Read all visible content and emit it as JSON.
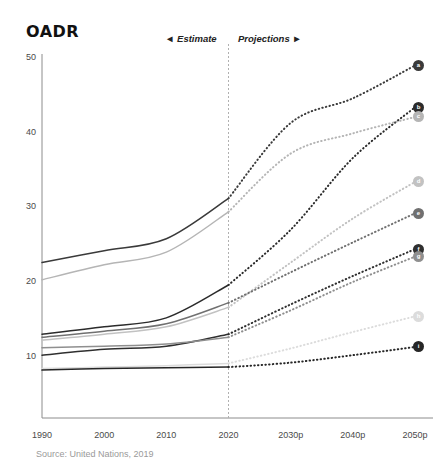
{
  "header": {
    "title": "OADR"
  },
  "annotations": {
    "estimate_label": "◄ Estimate",
    "projections_label": "Projections ►",
    "divider_year": 2020
  },
  "source": {
    "text": "Source: United Nations, 2019"
  },
  "colors": {
    "axis": "#8c8c8c",
    "tick_text": "#4a4a4a",
    "title": "#111111",
    "source_text": "#9a9a9a",
    "divider": "#b0b0b0"
  },
  "chart_data": {
    "type": "line",
    "title": "OADR",
    "xlabel": "",
    "ylabel": "",
    "xlim": [
      1990,
      2050
    ],
    "ylim": [
      5,
      50
    ],
    "yticks": [
      10,
      20,
      30,
      40,
      50
    ],
    "xticks": [
      "1990",
      "2000",
      "2010",
      "2020",
      "2030p",
      "2040p",
      "2050p"
    ],
    "xtick_values": [
      1990,
      2000,
      2010,
      2020,
      2030,
      2040,
      2050
    ],
    "grid": false,
    "legend": "none",
    "estimate_range": [
      1990,
      2020
    ],
    "projection_range": [
      2020,
      2050
    ],
    "x": [
      1990,
      2000,
      2010,
      2020,
      2030,
      2040,
      2050
    ],
    "series": [
      {
        "name": "series-a",
        "marker_letter": "a",
        "color": "#3a3a3a",
        "values": [
          22.6,
          24.2,
          25.8,
          31.2,
          41.3,
          44.6,
          49.0
        ]
      },
      {
        "name": "series-b",
        "marker_letter": "b",
        "color": "#2b2b2b",
        "values": [
          13.0,
          14.0,
          15.2,
          19.6,
          27.0,
          36.6,
          43.4
        ]
      },
      {
        "name": "series-c",
        "marker_letter": "c",
        "color": "#b5b5b5",
        "values": [
          20.3,
          22.3,
          24.0,
          29.4,
          37.2,
          39.9,
          42.1
        ]
      },
      {
        "name": "series-d",
        "marker_letter": "d",
        "color": "#c2c2c2",
        "values": [
          12.2,
          13.0,
          14.0,
          16.6,
          22.6,
          28.5,
          33.4
        ]
      },
      {
        "name": "series-e",
        "marker_letter": "e",
        "color": "#707070",
        "values": [
          12.6,
          13.4,
          14.4,
          17.2,
          21.3,
          25.3,
          29.2
        ]
      },
      {
        "name": "series-f",
        "marker_letter": "f",
        "color": "#2f2f2f",
        "values": [
          10.2,
          11.0,
          11.4,
          13.0,
          17.0,
          20.8,
          24.4
        ]
      },
      {
        "name": "series-g",
        "marker_letter": "g",
        "color": "#8f8f8f",
        "values": [
          11.2,
          11.4,
          11.7,
          12.6,
          16.2,
          20.0,
          23.4
        ]
      },
      {
        "name": "series-h",
        "marker_letter": "h",
        "color": "#dcdcdc",
        "values": [
          8.4,
          8.6,
          8.8,
          9.1,
          11.1,
          13.3,
          15.4
        ]
      },
      {
        "name": "series-i",
        "marker_letter": "i",
        "color": "#262626",
        "values": [
          8.2,
          8.4,
          8.5,
          8.6,
          9.2,
          10.2,
          11.3
        ]
      }
    ]
  }
}
